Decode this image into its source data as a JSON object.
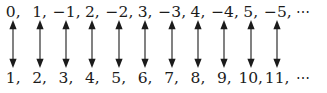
{
  "figure": {
    "background_color": "#ffffff",
    "text_color": "#1b1b1b",
    "arrow_color": "#1b1b1b",
    "arrow_icon": "double-headed-vertical-arrow-icon",
    "ellipsis_glyph": "⋯",
    "columns": 11,
    "top_row": {
      "label": "integers",
      "cells": [
        "0,",
        "1,",
        "−1,",
        "2,",
        "−2,",
        "3,",
        "−3,",
        "4,",
        "−4,",
        "5,",
        "−5,",
        "⋯"
      ]
    },
    "bottom_row": {
      "label": "positive-integers",
      "cells": [
        "1,",
        "2,",
        "3,",
        "4,",
        "5,",
        "6,",
        "7,",
        "8,",
        "9,",
        "10,",
        "11,",
        "⋯"
      ]
    },
    "arrows": [
      "↕",
      "↕",
      "↕",
      "↕",
      "↕",
      "↕",
      "↕",
      "↕",
      "↕",
      "↕",
      "↕",
      ""
    ]
  }
}
